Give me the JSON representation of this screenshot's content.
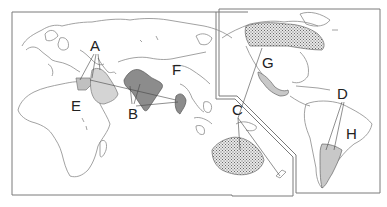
{
  "map": {
    "labels": [
      {
        "id": "A",
        "text": "A",
        "x": 90,
        "y": 38
      },
      {
        "id": "B",
        "text": "B",
        "x": 128,
        "y": 106
      },
      {
        "id": "C",
        "text": "C",
        "x": 232,
        "y": 102
      },
      {
        "id": "D",
        "text": "D",
        "x": 337,
        "y": 86
      },
      {
        "id": "E",
        "text": "E",
        "x": 71,
        "y": 98
      },
      {
        "id": "F",
        "text": "F",
        "x": 172,
        "y": 62
      },
      {
        "id": "G",
        "text": "G",
        "x": 262,
        "y": 55
      },
      {
        "id": "H",
        "text": "H",
        "x": 346,
        "y": 126
      }
    ],
    "regions": {
      "arabia": {
        "fill": "#d4d4d4",
        "pattern": "solid-light"
      },
      "egypt_levant": {
        "fill": "#c0c0c0",
        "pattern": "solid-light"
      },
      "india": {
        "fill": "#8c8c8c",
        "pattern": "solid-dark"
      },
      "southeast_asia": {
        "fill": "#8c8c8c",
        "pattern": "solid-dark"
      },
      "australia": {
        "fill": "#cfcfcf",
        "pattern": "stipple"
      },
      "canada": {
        "fill": "#cfcfcf",
        "pattern": "stipple"
      },
      "mexico": {
        "fill": "#c8c8c8",
        "pattern": "solid-light"
      },
      "argentina": {
        "fill": "#c8c8c8",
        "pattern": "solid-light"
      }
    },
    "colors": {
      "outline": "#8a8a8a",
      "frame": "#7a7a7a",
      "dark_fill": "#8c8c8c",
      "light_fill": "#d0d0d0"
    }
  }
}
